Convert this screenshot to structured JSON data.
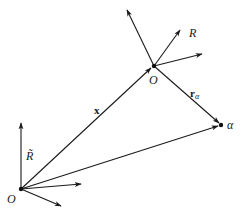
{
  "diagram": {
    "labels": {
      "lower_origin": "O",
      "upper_origin": "O",
      "lower_axis": "R̃",
      "upper_axis": "R",
      "position_vector": "x",
      "relative_vector_base": "r",
      "relative_vector_sub": "α",
      "particle": "α"
    },
    "colors": {
      "ink": "#1a1a1a",
      "background": "#ffffff"
    }
  }
}
